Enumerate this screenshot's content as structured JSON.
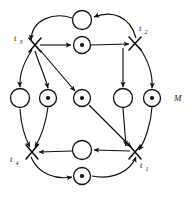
{
  "figure": {
    "type": "petri-net",
    "title": "",
    "marking_label": "M",
    "background_color": "#ffffff",
    "ink_color": "#101010"
  },
  "transitions": [
    {
      "id": "t1",
      "label": "t",
      "subscript": "1",
      "x": 135,
      "y": 152,
      "label_x": 141,
      "label_y": 165
    },
    {
      "id": "t2",
      "label": "t",
      "subscript": "2",
      "x": 135,
      "y": 43,
      "label_x": 141,
      "label_y": 33
    },
    {
      "id": "t3",
      "label": "t",
      "subscript": "3",
      "x": 35,
      "y": 45,
      "label_x": 14,
      "label_y": 41
    },
    {
      "id": "t4",
      "label": "t",
      "subscript": "4",
      "x": 32,
      "y": 152,
      "label_x": 11,
      "label_y": 162
    }
  ],
  "places": [
    {
      "id": "p-top-outer",
      "x": 82,
      "y": 20,
      "r": 9.5,
      "tokens": 0
    },
    {
      "id": "p-top-inner",
      "x": 82,
      "y": 45,
      "r": 8.5,
      "tokens": 1
    },
    {
      "id": "p-left-outer",
      "x": 20,
      "y": 98,
      "r": 9.5,
      "tokens": 0
    },
    {
      "id": "p-left-inner",
      "x": 48,
      "y": 98,
      "r": 8.5,
      "tokens": 1
    },
    {
      "id": "p-center",
      "x": 82,
      "y": 98,
      "r": 8.5,
      "tokens": 1
    },
    {
      "id": "p-right-inner",
      "x": 123,
      "y": 98,
      "r": 9.5,
      "tokens": 0
    },
    {
      "id": "p-right-outer",
      "x": 152,
      "y": 98,
      "r": 8.5,
      "tokens": 1
    },
    {
      "id": "p-bottom-inner",
      "x": 82,
      "y": 150,
      "r": 9.5,
      "tokens": 0
    },
    {
      "id": "p-bottom-outer",
      "x": 82,
      "y": 176,
      "r": 8.5,
      "tokens": 1
    }
  ],
  "arcs": [
    {
      "id": "arc-top-outer-to-t3",
      "from": "p-top-outer",
      "to": "t3",
      "shape": "curve"
    },
    {
      "id": "arc-t2-to-top-outer",
      "from": "t2",
      "to": "p-top-outer",
      "shape": "curve"
    },
    {
      "id": "arc-t3-to-top-inner",
      "from": "t3",
      "to": "p-top-inner",
      "shape": "line"
    },
    {
      "id": "arc-top-inner-to-t2",
      "from": "p-top-inner",
      "to": "t2",
      "shape": "line"
    },
    {
      "id": "arc-t3-to-left-outer",
      "from": "t3",
      "to": "p-left-outer",
      "shape": "curve"
    },
    {
      "id": "arc-left-outer-to-t4",
      "from": "p-left-outer",
      "to": "t4",
      "shape": "curve"
    },
    {
      "id": "arc-t3-to-left-inner",
      "from": "t3",
      "to": "p-left-inner",
      "shape": "curve"
    },
    {
      "id": "arc-left-inner-to-t4",
      "from": "p-left-inner",
      "to": "t4",
      "shape": "curve"
    },
    {
      "id": "arc-t3-to-center",
      "from": "t3",
      "to": "p-center",
      "shape": "line"
    },
    {
      "id": "arc-center-to-t1",
      "from": "p-center",
      "to": "t1",
      "shape": "line"
    },
    {
      "id": "arc-t2-to-right-inner",
      "from": "t2",
      "to": "p-right-inner",
      "shape": "line"
    },
    {
      "id": "arc-right-inner-to-t1",
      "from": "p-right-inner",
      "to": "t1",
      "shape": "line"
    },
    {
      "id": "arc-t2-to-right-outer",
      "from": "t2",
      "to": "p-right-outer",
      "shape": "curve"
    },
    {
      "id": "arc-right-outer-to-t1",
      "from": "p-right-outer",
      "to": "t1",
      "shape": "curve"
    },
    {
      "id": "arc-bottom-inner-to-t4",
      "from": "p-bottom-inner",
      "to": "t4",
      "shape": "line"
    },
    {
      "id": "arc-t1-to-bottom-inner",
      "from": "t1",
      "to": "p-bottom-inner",
      "shape": "line"
    },
    {
      "id": "arc-t4-to-bottom-outer",
      "from": "t4",
      "to": "p-bottom-outer",
      "shape": "curve"
    },
    {
      "id": "arc-bottom-outer-to-t1",
      "from": "p-bottom-outer",
      "to": "t1",
      "shape": "curve"
    }
  ]
}
